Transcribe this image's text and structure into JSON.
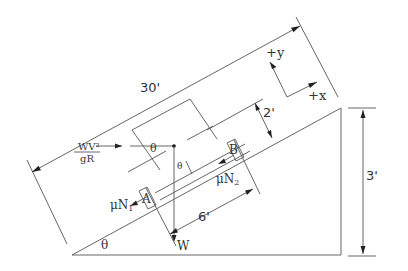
{
  "diagram": {
    "type": "free-body-diagram",
    "labels": {
      "length_30": "30'",
      "height_2": "2'",
      "height_3": "3'",
      "width_6": "6'",
      "axis_x": "+x",
      "axis_y": "+y",
      "centrifugal_num": "WV²",
      "centrifugal_den": "gR",
      "theta_base": "θ",
      "theta_top": "θ",
      "theta_small": "θ",
      "support_a": "A",
      "support_b": "B",
      "friction_1": "μN",
      "friction_1_sub": "1",
      "friction_2": "μN",
      "friction_2_sub": "2",
      "weight": "W"
    },
    "colors": {
      "line": "#555555",
      "text": "#333333",
      "background": "#ffffff"
    }
  }
}
